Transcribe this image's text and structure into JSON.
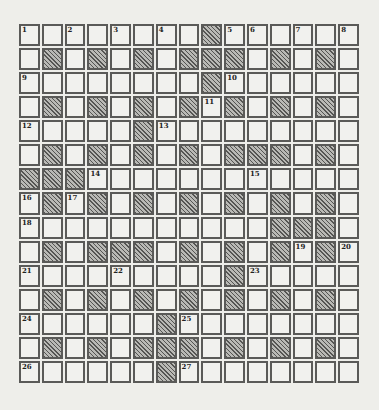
{
  "puzzle": {
    "rows": 15,
    "cols": 15,
    "colors": {
      "background": "#eeeeea",
      "cell": "#f1f1ee",
      "border": "#5a5a58",
      "block": "#8a8a86"
    },
    "layout": [
      "1_2_3_4_#56_7_8",
      "_#_#_#_###_#_#_",
      "9_______#A_____",
      "_#_#_#_#B#_#_#_",
      "C____#D________",
      "_#_#_#_#_###_#_",
      "###E______F____",
      "G#H#_#_#_#_#_#_",
      "I__________###_",
      "_#_###_#_#_#J#K",
      "L___M____#N____",
      "_#_#_#_#_#_#_#_",
      "O_____#P_______",
      "_#_#_###_#_#_#_",
      "Q_____#R_______"
    ],
    "numbers": {
      "0,0": "1",
      "0,2": "2",
      "0,4": "3",
      "0,6": "4",
      "0,9": "5",
      "0,10": "6",
      "0,12": "7",
      "0,14": "8",
      "2,0": "9",
      "2,9": "10",
      "3,8": "11",
      "4,0": "12",
      "4,6": "13",
      "6,3": "14",
      "6,10": "15",
      "7,0": "16",
      "7,2": "17",
      "8,0": "18",
      "9,12": "19",
      "9,14": "20",
      "10,0": "21",
      "10,4": "22",
      "10,10": "23",
      "12,0": "24",
      "12,7": "25",
      "14,0": "26",
      "14,7": "27"
    }
  }
}
